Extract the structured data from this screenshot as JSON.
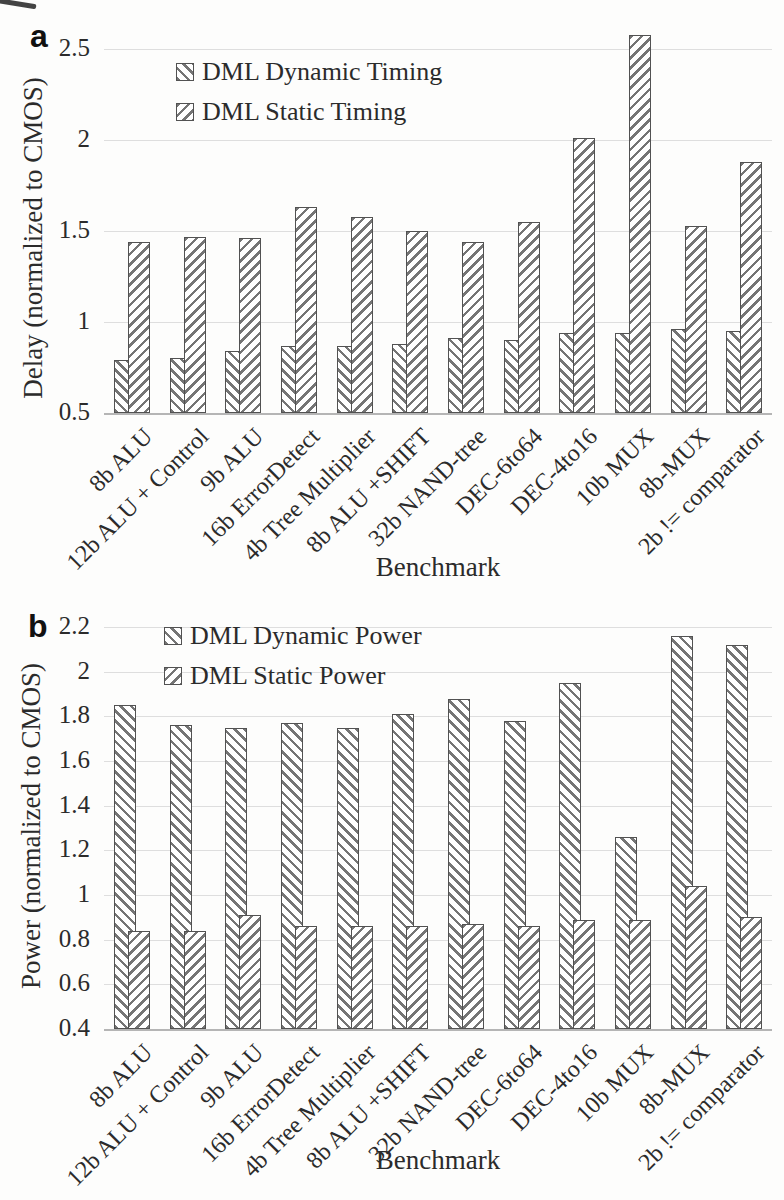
{
  "chart_data": [
    {
      "type": "bar",
      "panel_label": "a",
      "title": "",
      "xlabel": "Benchmark",
      "ylabel": "Delay (normalized to CMOS)",
      "ylim": [
        0.5,
        2.5
      ],
      "yticks": [
        0.5,
        1,
        1.5,
        2,
        2.5
      ],
      "ytick_labels": [
        "0.5",
        "1",
        "1.5",
        "2",
        "2.5"
      ],
      "grid": true,
      "legend_position": "top-left-inside",
      "categories": [
        "8b ALU",
        "12b ALU + Control",
        "9b ALU",
        "16b ErrorDetect",
        "4b Tree Multiplier",
        "8b ALU +SHIFT",
        "32b NAND-tree",
        "DEC-6to64",
        "DEC-4to16",
        "10b MUX",
        "8b-MUX",
        "2b != comparator"
      ],
      "series": [
        {
          "name": "DML Dynamic Timing",
          "pattern": "backslash-hatch",
          "values": [
            0.79,
            0.8,
            0.84,
            0.87,
            0.87,
            0.88,
            0.91,
            0.9,
            0.94,
            0.94,
            0.96,
            0.95
          ]
        },
        {
          "name": "DML Static Timing",
          "pattern": "slash-hatch",
          "values": [
            1.44,
            1.47,
            1.46,
            1.63,
            1.58,
            1.5,
            1.44,
            1.55,
            2.01,
            2.58,
            1.53,
            1.88
          ]
        }
      ]
    },
    {
      "type": "bar",
      "panel_label": "b",
      "title": "",
      "xlabel": "Benchmark",
      "ylabel": "Power (normalized to CMOS)",
      "ylim": [
        0.4,
        2.2
      ],
      "yticks": [
        0.4,
        0.6,
        0.8,
        1,
        1.2,
        1.4,
        1.6,
        1.8,
        2,
        2.2
      ],
      "ytick_labels": [
        "0.4",
        "0.6",
        "0.8",
        "1",
        "1.2",
        "1.4",
        "1.6",
        "1.8",
        "2",
        "2.2"
      ],
      "grid": true,
      "legend_position": "top-left-inside",
      "categories": [
        "8b ALU",
        "12b ALU + Control",
        "9b ALU",
        "16b ErrorDetect",
        "4b Tree Multiplier",
        "8b ALU +SHIFT",
        "32b NAND-tree",
        "DEC-6to64",
        "DEC-4to16",
        "10b MUX",
        "8b-MUX",
        "2b != comparator"
      ],
      "series": [
        {
          "name": "DML Dynamic Power",
          "pattern": "backslash-hatch",
          "values": [
            1.85,
            1.76,
            1.75,
            1.77,
            1.75,
            1.81,
            1.88,
            1.78,
            1.95,
            1.26,
            2.16,
            2.12
          ]
        },
        {
          "name": "DML Static Power",
          "pattern": "slash-hatch",
          "values": [
            0.84,
            0.84,
            0.91,
            0.86,
            0.86,
            0.86,
            0.87,
            0.86,
            0.89,
            0.89,
            1.04,
            0.9
          ]
        }
      ]
    }
  ]
}
